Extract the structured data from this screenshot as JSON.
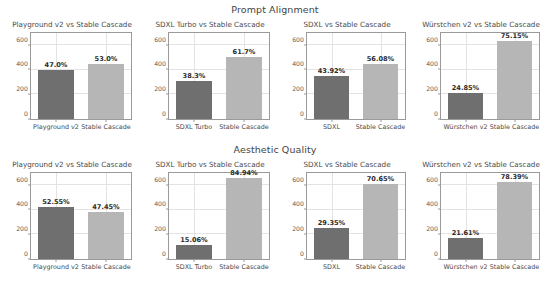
{
  "figure": {
    "width": 550,
    "height": 281,
    "background": "#ffffff",
    "bar_colors": {
      "dark": "#6f6f6f",
      "light": "#b6b6b6"
    },
    "grid_color": "#e3e3e3",
    "axis_color": "#9a9a9a"
  },
  "chart_data": [
    {
      "type": "bar",
      "title": "Playground v2 vs Stable Cascade",
      "suptitle": "Prompt Alignment",
      "categories": [
        "Playground v2",
        "Stable Cascade"
      ],
      "values": [
        397,
        448
      ],
      "data_labels": [
        "47.0%",
        "53.0%"
      ],
      "xlabel": "",
      "ylabel": "",
      "ylim": [
        0,
        700
      ],
      "yticks": [
        0,
        200,
        400,
        600
      ],
      "ytick_labels": [
        "0",
        "200",
        "400",
        "600"
      ],
      "grid": true,
      "legend": "none"
    },
    {
      "type": "bar",
      "title": "SDXL Turbo vs Stable Cascade",
      "suptitle": "Prompt Alignment",
      "categories": [
        "SDXL Turbo",
        "Stable Cascade"
      ],
      "values": [
        313,
        504
      ],
      "data_labels": [
        "38.3%",
        "61.7%"
      ],
      "xlabel": "",
      "ylabel": "",
      "ylim": [
        0,
        700
      ],
      "yticks": [
        0,
        200,
        400,
        600
      ],
      "ytick_labels": [
        "0",
        "200",
        "400",
        "600"
      ],
      "grid": true,
      "legend": "none"
    },
    {
      "type": "bar",
      "title": "SDXL vs Stable Cascade",
      "suptitle": "Prompt Alignment",
      "categories": [
        "SDXL",
        "Stable Cascade"
      ],
      "values": [
        348,
        444
      ],
      "data_labels": [
        "43.92%",
        "56.08%"
      ],
      "xlabel": "",
      "ylabel": "",
      "ylim": [
        0,
        700
      ],
      "yticks": [
        0,
        200,
        400,
        600
      ],
      "ytick_labels": [
        "0",
        "200",
        "400",
        "600"
      ],
      "grid": true,
      "legend": "none"
    },
    {
      "type": "bar",
      "title": "Würstchen v2 vs Stable Cascade",
      "suptitle": "Prompt Alignment",
      "categories": [
        "Würstchen v2",
        "Stable Cascade"
      ],
      "values": [
        211,
        638
      ],
      "data_labels": [
        "24.85%",
        "75.15%"
      ],
      "xlabel": "",
      "ylabel": "",
      "ylim": [
        0,
        700
      ],
      "yticks": [
        0,
        200,
        400,
        600
      ],
      "ytick_labels": [
        "0",
        "200",
        "400",
        "600"
      ],
      "grid": true,
      "legend": "none"
    },
    {
      "type": "bar",
      "title": "Playground v2 vs Stable Cascade",
      "suptitle": "Aesthetic Quality",
      "categories": [
        "Playground v2",
        "Stable Cascade"
      ],
      "values": [
        424,
        383
      ],
      "data_labels": [
        "52.55%",
        "47.45%"
      ],
      "xlabel": "",
      "ylabel": "",
      "ylim": [
        0,
        700
      ],
      "yticks": [
        0,
        200,
        400,
        600
      ],
      "ytick_labels": [
        "0",
        "200",
        "400",
        "600"
      ],
      "grid": true,
      "legend": "none"
    },
    {
      "type": "bar",
      "title": "SDXL Turbo vs Stable Cascade",
      "suptitle": "Aesthetic Quality",
      "categories": [
        "SDXL Turbo",
        "Stable Cascade"
      ],
      "values": [
        117,
        660
      ],
      "data_labels": [
        "15.06%",
        "84.94%"
      ],
      "xlabel": "",
      "ylabel": "",
      "ylim": [
        0,
        700
      ],
      "yticks": [
        0,
        200,
        400,
        600
      ],
      "ytick_labels": [
        "0",
        "200",
        "400",
        "600"
      ],
      "grid": true,
      "legend": "none"
    },
    {
      "type": "bar",
      "title": "SDXL vs Stable Cascade",
      "suptitle": "Aesthetic Quality",
      "categories": [
        "SDXL",
        "Stable Cascade"
      ],
      "values": [
        255,
        614
      ],
      "data_labels": [
        "29.35%",
        "70.65%"
      ],
      "xlabel": "",
      "ylabel": "",
      "ylim": [
        0,
        700
      ],
      "yticks": [
        0,
        200,
        400,
        600
      ],
      "ytick_labels": [
        "0",
        "200",
        "400",
        "600"
      ],
      "grid": true,
      "legend": "none"
    },
    {
      "type": "bar",
      "title": "Würstchen v2 vs Stable Cascade",
      "suptitle": "Aesthetic Quality",
      "categories": [
        "Würstchen v2",
        "Stable Cascade"
      ],
      "values": [
        172,
        624
      ],
      "data_labels": [
        "21.61%",
        "78.39%"
      ],
      "xlabel": "",
      "ylabel": "",
      "ylim": [
        0,
        700
      ],
      "yticks": [
        0,
        200,
        400,
        600
      ],
      "ytick_labels": [
        "0",
        "200",
        "400",
        "600"
      ],
      "grid": true,
      "legend": "none"
    }
  ],
  "rows": [
    {
      "suptitle": "Prompt Alignment",
      "panel_indices": [
        0,
        1,
        2,
        3
      ]
    },
    {
      "suptitle": "Aesthetic Quality",
      "panel_indices": [
        4,
        5,
        6,
        7
      ]
    }
  ]
}
